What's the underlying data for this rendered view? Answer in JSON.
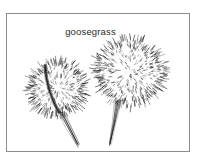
{
  "figure": {
    "caption": "goosegrass",
    "medium": "pen-and-ink stipple botanical drawing",
    "background_color": "#ffffff",
    "ink_color": "#141414",
    "frame": {
      "border_color": "#8d8d8d",
      "border_width_px": 1,
      "left_px": 6,
      "top_px": 13,
      "width_px": 184,
      "height_px": 139
    },
    "caption_style": {
      "color": "#2a2a2a",
      "font_size_px": 9.5,
      "align": "center",
      "top_px": 26
    }
  },
  "specimens": [
    {
      "name": "left-seedhead",
      "label": "left goosegrass burr",
      "center_x": 51,
      "center_y": 75,
      "radius_x": 29,
      "radius_y": 27,
      "rotation_deg": -12,
      "spike_count": 150,
      "stipple_count": 300,
      "has_central_ridge": true,
      "ridge_color": "#111111",
      "stem": {
        "from_x": 55,
        "from_y": 99,
        "to_x": 72,
        "to_y": 135,
        "width_px": 2.6
      }
    },
    {
      "name": "right-seedhead",
      "label": "right goosegrass burr",
      "center_x": 124,
      "center_y": 59,
      "radius_x": 35,
      "radius_y": 33,
      "rotation_deg": 6,
      "spike_count": 195,
      "stipple_count": 380,
      "has_central_ridge": false,
      "ridge_color": "#111111",
      "stem": {
        "from_x": 112,
        "from_y": 88,
        "to_x": 104,
        "to_y": 135,
        "width_px": 3.0
      }
    }
  ]
}
